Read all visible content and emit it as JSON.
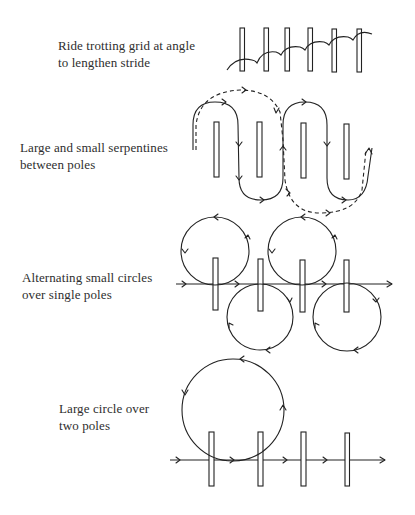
{
  "exercises": [
    {
      "id": "trotting-grid",
      "lines": [
        "Ride trotting grid at angle",
        "to lengthen stride"
      ],
      "pole_count": 6,
      "path": "arcing strides crossing poles diagonally"
    },
    {
      "id": "serpentines",
      "lines": [
        "Large and small serpentines",
        "between poles"
      ],
      "pole_count": 4,
      "path": "solid small serpentine loops and dashed large serpentine loops"
    },
    {
      "id": "alternating-circles",
      "lines": [
        "Alternating small circles",
        "over single poles"
      ],
      "pole_count": 4,
      "circle_count": 4,
      "path": "straight line with circles alternating above and below"
    },
    {
      "id": "large-circle",
      "lines": [
        "Large circle over",
        "two poles"
      ],
      "pole_count": 4,
      "circle_count": 1,
      "path": "straight line with one large circle spanning two poles"
    }
  ],
  "colors": {
    "ink": "#222222",
    "text": "#2e2e2e",
    "background": "#ffffff"
  }
}
